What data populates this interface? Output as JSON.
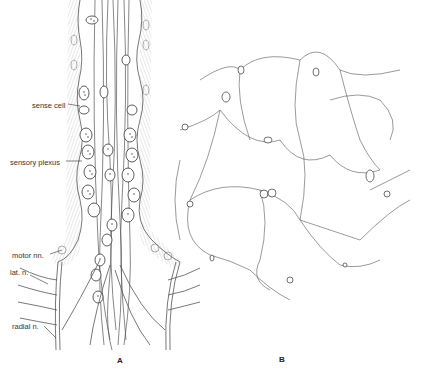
{
  "figure": {
    "panels": [
      {
        "id": "A",
        "label": "A",
        "annotations": [
          {
            "text": "sense cell"
          },
          {
            "text": "sensory plexus"
          },
          {
            "text": "motor nn."
          },
          {
            "text": "lat. n."
          },
          {
            "text": "radial n."
          }
        ]
      },
      {
        "id": "B",
        "label": "B"
      }
    ],
    "colors": {
      "ink": "#3a3a3a",
      "hatch": "#9a9a9a",
      "background": "#ffffff"
    }
  }
}
